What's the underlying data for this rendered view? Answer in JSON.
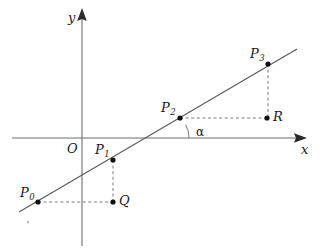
{
  "figure": {
    "type": "geometry-diagram",
    "background_color": "#ffffff",
    "line_color": "#5a5a5a",
    "axis_color": "#6e6e6e",
    "dash_color": "#7a7a7a",
    "dot_color": "#111111"
  },
  "axes": {
    "x_label": "x",
    "y_label": "y",
    "origin_label": "O",
    "x_axis": {
      "x1": 12,
      "y1": 138,
      "x2": 300,
      "y2": 138
    },
    "y_axis": {
      "x1": 82,
      "y1": 14,
      "x2": 82,
      "y2": 246
    },
    "x_arrow_tip": {
      "x": 307,
      "y": 138
    },
    "y_arrow_tip": {
      "x": 82,
      "y": 8
    },
    "x_label_pos": {
      "x": 301,
      "y": 143
    },
    "y_label_pos": {
      "x": 68,
      "y": 11
    },
    "origin_label_pos": {
      "x": 67,
      "y": 142
    }
  },
  "main_line": {
    "x1": 19,
    "y1": 212,
    "x2": 297,
    "y2": 49
  },
  "angle": {
    "label": "α",
    "label_pos": {
      "x": 196,
      "y": 126
    },
    "vertex": {
      "x": 163,
      "y": 138
    },
    "arc_radius": 26
  },
  "points": [
    {
      "name": "P0",
      "base": "P",
      "sub": "0",
      "x": 38,
      "y": 202,
      "label_x": 20,
      "label_y": 186
    },
    {
      "name": "P1",
      "base": "P",
      "sub": "1",
      "x": 113,
      "y": 160,
      "label_x": 95,
      "label_y": 143
    },
    {
      "name": "P2",
      "base": "P",
      "sub": "2",
      "x": 180,
      "y": 118,
      "label_x": 161,
      "label_y": 101
    },
    {
      "name": "P3",
      "base": "P",
      "sub": "3",
      "x": 268,
      "y": 64,
      "label_x": 250,
      "label_y": 47
    },
    {
      "name": "Q",
      "base": "Q",
      "sub": "",
      "x": 113,
      "y": 202,
      "label_x": 119,
      "label_y": 196
    },
    {
      "name": "R",
      "base": "R",
      "sub": "",
      "x": 267,
      "y": 118,
      "label_x": 273,
      "label_y": 112
    }
  ],
  "guides": [
    {
      "name": "p0-to-q-horizontal",
      "x1": 38,
      "y1": 202,
      "x2": 113,
      "y2": 202
    },
    {
      "name": "p1-to-q-vertical",
      "x1": 113,
      "y1": 160,
      "x2": 113,
      "y2": 202
    },
    {
      "name": "p2-to-r-horizontal",
      "x1": 180,
      "y1": 118,
      "x2": 267,
      "y2": 118
    },
    {
      "name": "p3-to-r-vertical",
      "x1": 268,
      "y1": 64,
      "x2": 268,
      "y2": 118
    }
  ],
  "stray_mark": {
    "x": 28,
    "y": 222
  }
}
